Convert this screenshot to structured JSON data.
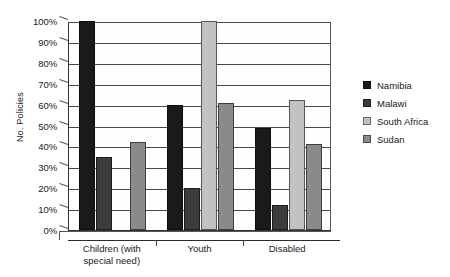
{
  "chart_data": {
    "type": "bar",
    "title": "",
    "subtitle": "",
    "xlabel": "",
    "ylabel": "No. Policies",
    "ylim": [
      0,
      100
    ],
    "ytick_step": 10,
    "ytick_labels": [
      "100%",
      "90%",
      "80%",
      "70%",
      "60%",
      "50%",
      "40%",
      "30%",
      "20%",
      "10%",
      "0%"
    ],
    "grid": "horizontal",
    "legend_position": "right",
    "categories": [
      "Children (with special need)",
      "Youth",
      "Disabled"
    ],
    "category_lines": [
      [
        "Children (with",
        "special need)"
      ],
      [
        "Youth"
      ],
      [
        "Disabled"
      ]
    ],
    "series": [
      {
        "name": "Namibia",
        "color": "#1a1a1a",
        "values": [
          100,
          60,
          49
        ]
      },
      {
        "name": "Malawi",
        "color": "#3d3d3d",
        "values": [
          35,
          20,
          12
        ]
      },
      {
        "name": "South Africa",
        "color": "#c2c2c2",
        "values": [
          0,
          100,
          62
        ]
      },
      {
        "name": "Sudan",
        "color": "#8a8a8a",
        "values": [
          42,
          61,
          41
        ]
      }
    ]
  },
  "colors": {
    "axis": "#2b2b2b",
    "grid": "#4a4a4a",
    "background": "#ffffff",
    "plot_background": "#fefefe"
  }
}
